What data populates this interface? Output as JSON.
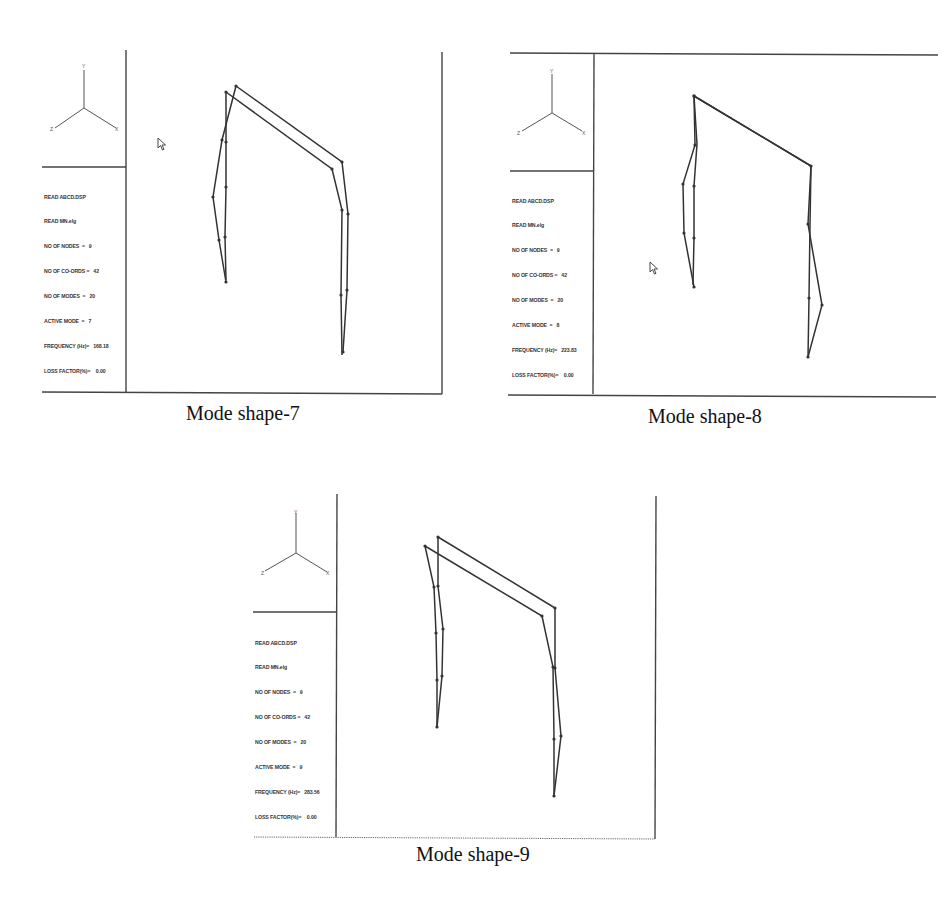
{
  "figure": {
    "panels": [
      {
        "id": "mode-7",
        "caption": "Mode shape-7",
        "axis_triad": {
          "y": "Y",
          "z": "Z",
          "x": "X"
        },
        "info_lines": [
          "READ ABCD.DSP",
          "READ MN.elg",
          "NO OF NODES  =   9",
          "NO OF CO-ORDS =   42",
          "NO OF MODES  =   20",
          "ACTIVE MODE  =   7",
          "FREQUENCY (Hz)=   168.18",
          "LOSS FACTOR(%)=    0.00"
        ],
        "active_mode": 7,
        "frequency_hz": 168.18,
        "loss_factor_pct": 0.0
      },
      {
        "id": "mode-8",
        "caption": "Mode shape-8",
        "axis_triad": {
          "y": "Y",
          "z": "Z",
          "x": "X"
        },
        "info_lines": [
          "READ ABCD.DSP",
          "READ MN.elg",
          "NO OF NODES  =   9",
          "NO OF CO-ORDS =   42",
          "NO OF MODES  =   20",
          "ACTIVE MODE  =   8",
          "FREQUENCY (Hz)=   223.83",
          "LOSS FACTOR(%)=    0.00"
        ],
        "active_mode": 8,
        "frequency_hz": 223.83,
        "loss_factor_pct": 0.0
      },
      {
        "id": "mode-9",
        "caption": "Mode shape-9",
        "axis_triad": {
          "y": "Y",
          "z": "Z",
          "x": "X"
        },
        "info_lines": [
          "READ ABCD.DSP",
          "READ MN.elg",
          "NO OF NODES  =   9",
          "NO OF CO-ORDS =   42",
          "NO OF MODES  =   20",
          "ACTIVE MODE  =   9",
          "FREQUENCY (Hz)=   283.56",
          "LOSS FACTOR(%)=    0.00"
        ],
        "active_mode": 9,
        "frequency_hz": 283.56,
        "loss_factor_pct": 0.0
      }
    ],
    "colors": {
      "line": "#333333",
      "frame": "#444444",
      "background": "#ffffff"
    }
  }
}
